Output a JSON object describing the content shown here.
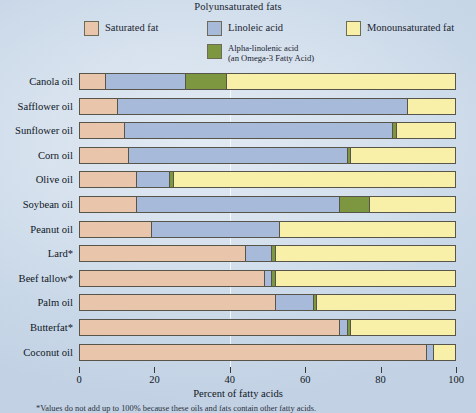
{
  "legend": {
    "group_title": "Polyunsaturated fats",
    "entries": [
      {
        "key": "saturated",
        "label": "Saturated fat",
        "color": "#e9c5ab"
      },
      {
        "key": "linoleic",
        "label": "Linoleic acid",
        "color": "#a8bada"
      },
      {
        "key": "alphalin",
        "label": "Alpha-linolenic acid\n(an Omega-3 Fatty Acid)",
        "color": "#7d9640"
      },
      {
        "key": "mono",
        "label": "Monounsaturated fat",
        "color": "#f8f0a8"
      }
    ]
  },
  "chart_data": {
    "type": "bar",
    "orientation": "horizontal",
    "stacked": true,
    "title": "",
    "xlabel": "Percent of fatty acids",
    "ylabel": "",
    "xlim": [
      0,
      100
    ],
    "xticks": [
      0,
      20,
      40,
      60,
      80,
      100
    ],
    "xticklabels": [
      "0",
      "20",
      "40",
      "60",
      "80",
      "100"
    ],
    "grid": false,
    "legend_position": "top",
    "categories": [
      "Canola oil",
      "Safflower oil",
      "Sunflower oil",
      "Corn oil",
      "Olive oil",
      "Soybean oil",
      "Peanut oil",
      "Lard*",
      "Beef tallow*",
      "Palm oil",
      "Butterfat*",
      "Coconut oil"
    ],
    "series": [
      {
        "name": "Saturated fat",
        "color": "#e9c5ab",
        "values": [
          7,
          10,
          12,
          13,
          15,
          15,
          19,
          44,
          49,
          52,
          69,
          92
        ]
      },
      {
        "name": "Linoleic acid",
        "color": "#a8bada",
        "values": [
          21,
          77,
          71,
          58,
          9,
          54,
          34,
          7,
          2,
          10,
          2,
          2
        ]
      },
      {
        "name": "Alpha-linolenic acid",
        "color": "#7d9640",
        "values": [
          11,
          0,
          1,
          1,
          1,
          8,
          0,
          1,
          1,
          1,
          1,
          0
        ]
      },
      {
        "name": "Monounsaturated fat",
        "color": "#f8f0a8",
        "values": [
          61,
          13,
          16,
          28,
          75,
          23,
          47,
          48,
          48,
          37,
          28,
          6
        ]
      }
    ]
  },
  "axis_title": "Percent of fatty acids",
  "footnote": "*Values do not add up to 100% because these oils and fats contain other fatty acids."
}
